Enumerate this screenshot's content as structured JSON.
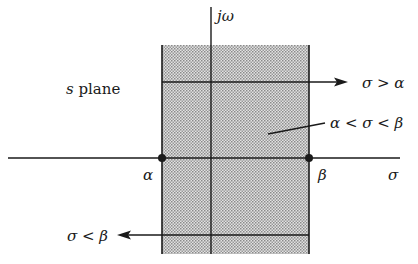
{
  "diagram": {
    "title": "s plane",
    "title_parts": {
      "var": "s",
      "rest": " plane"
    },
    "axes": {
      "horizontal_label": "σ",
      "vertical_label": "jω"
    },
    "points": [
      {
        "name": "alpha",
        "label": "α"
      },
      {
        "name": "beta",
        "label": "β"
      }
    ],
    "annotations": {
      "right_half": "σ > α",
      "strip": "α < σ < β",
      "left_half": "σ < β"
    },
    "region": {
      "description": "Shaded vertical strip between σ = α and σ = β (region of convergence)",
      "fill_color": "#c8c8c8"
    },
    "colors": {
      "ink": "#1a1a1a",
      "background": "#ffffff"
    }
  }
}
